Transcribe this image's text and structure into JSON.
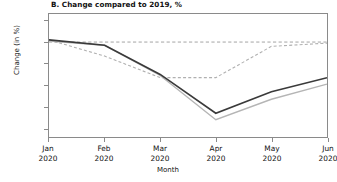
{
  "chart_data": {
    "type": "line",
    "title": "B. Change compared to 2019, %",
    "xlabel": "Month",
    "ylabel": "Change (in %)",
    "categories": [
      "Jan 2020",
      "Feb 2020",
      "Mar 2020",
      "Apr 2020",
      "May 2020",
      "Jun 2020"
    ],
    "x_tick_lines": [
      {
        "month": "Jan",
        "year": "2020"
      },
      {
        "month": "Feb",
        "year": "2020"
      },
      {
        "month": "Mar",
        "year": "2020"
      },
      {
        "month": "Apr",
        "year": "2020"
      },
      {
        "month": "May",
        "year": "2020"
      },
      {
        "month": "Jun",
        "year": "2020"
      }
    ],
    "ylim": [
      -88,
      26
    ],
    "yticks": [
      20,
      0,
      -20,
      -40,
      -60,
      -80
    ],
    "ytick_labels": [
      "20",
      "0",
      "-20",
      "-40",
      "-60",
      "-80"
    ],
    "grid": false,
    "legend": "none",
    "reference_line": {
      "y": 0,
      "style": "dashed",
      "color": "#9a9a9a"
    },
    "series": [
      {
        "name": "series-dark-solid",
        "style": "solid",
        "color": "#3a3a3a",
        "width": 1.6,
        "values": [
          2,
          -3,
          -30,
          -66,
          -46,
          -33
        ]
      },
      {
        "name": "series-light-solid",
        "style": "solid",
        "color": "#b5b5b5",
        "width": 1.4,
        "values": [
          1,
          -3,
          -31,
          -72,
          -53,
          -39
        ]
      },
      {
        "name": "series-light-dashed",
        "style": "dashed",
        "color": "#b0b0b0",
        "width": 1.1,
        "values": [
          2,
          -13,
          -33,
          -33,
          -4,
          -1
        ]
      }
    ]
  }
}
